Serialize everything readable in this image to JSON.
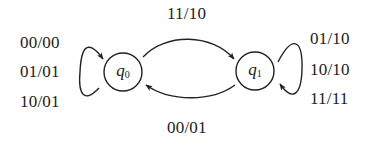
{
  "diagram": {
    "type": "finite-state-machine",
    "states": [
      {
        "id": "q0",
        "name": "q",
        "subscript": "0"
      },
      {
        "id": "q1",
        "name": "q",
        "subscript": "1"
      }
    ],
    "transitions": [
      {
        "from": "q0",
        "to": "q0",
        "labels": [
          "00/00",
          "01/01",
          "10/01"
        ]
      },
      {
        "from": "q0",
        "to": "q1",
        "labels": [
          "11/10"
        ]
      },
      {
        "from": "q1",
        "to": "q0",
        "labels": [
          "00/01"
        ]
      },
      {
        "from": "q1",
        "to": "q1",
        "labels": [
          "01/10",
          "10/10",
          "11/11"
        ]
      }
    ],
    "labels": {
      "q0_loop": [
        "00/00",
        "01/01",
        "10/01"
      ],
      "q0_to_q1": "11/10",
      "q1_to_q0": "00/01",
      "q1_loop": [
        "01/10",
        "10/10",
        "11/11"
      ]
    },
    "colors": {
      "stroke": "#222222",
      "background": "#ffffff"
    }
  }
}
